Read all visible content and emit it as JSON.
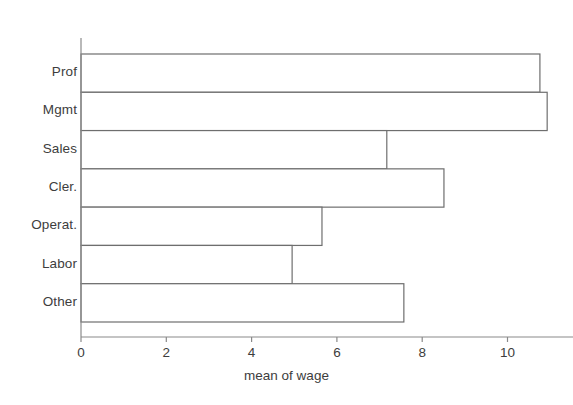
{
  "chart_data": {
    "type": "bar",
    "orientation": "horizontal",
    "title": "",
    "xlabel": "mean of wage",
    "ylabel": "",
    "categories": [
      "Prof",
      "Mgmt",
      "Sales",
      "Cler.",
      "Operat.",
      "Labor",
      "Other"
    ],
    "values": [
      10.76,
      10.93,
      7.17,
      8.51,
      5.65,
      4.95,
      7.57
    ],
    "xlim": [
      0,
      11.55
    ],
    "x_ticks": [
      0,
      2,
      4,
      6,
      8,
      10
    ],
    "x_tick_labels": [
      "0",
      "2",
      "4",
      "6",
      "8",
      "10"
    ],
    "grid": false,
    "legend": null,
    "bar_fill": "#ffffff",
    "bar_edge": "#6e6e6e",
    "axis_color": "#8a8a8a",
    "text_color": "#3d3d3d",
    "background": "#ffffff"
  },
  "axis": {
    "x_title": "mean of wage"
  }
}
